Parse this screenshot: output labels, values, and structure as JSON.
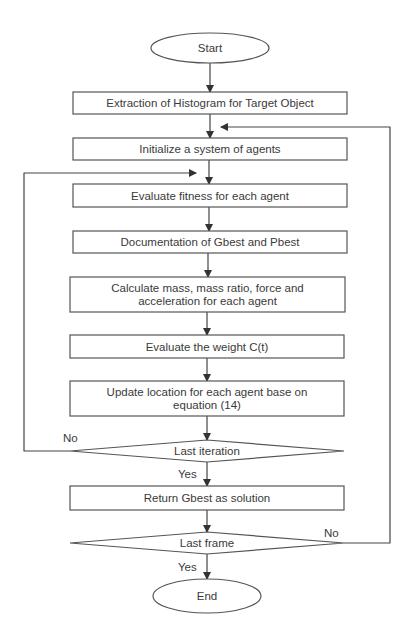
{
  "diagram": {
    "type": "flowchart",
    "colors": {
      "stroke": "#555555",
      "edge": "#444444",
      "text": "#3a3a3a",
      "fill": "#ffffff"
    },
    "nodes": [
      {
        "id": "start",
        "shape": "ellipse",
        "cx": 210,
        "cy": 48,
        "rx": 59,
        "ry": 15,
        "lines": [
          "Start"
        ]
      },
      {
        "id": "extract",
        "shape": "rect",
        "x": 73,
        "y": 92,
        "w": 274,
        "h": 22,
        "lines": [
          "Extraction of Histogram for Target Object"
        ]
      },
      {
        "id": "init",
        "shape": "rect",
        "x": 73,
        "y": 138,
        "w": 274,
        "h": 22,
        "lines": [
          "Initialize a system of agents"
        ]
      },
      {
        "id": "fitness",
        "shape": "rect",
        "x": 73,
        "y": 184,
        "w": 274,
        "h": 23,
        "lines": [
          "Evaluate fitness for each agent"
        ]
      },
      {
        "id": "document",
        "shape": "rect",
        "x": 73,
        "y": 231,
        "w": 274,
        "h": 22,
        "lines": [
          "Documentation of Gbest and Pbest"
        ]
      },
      {
        "id": "calculate",
        "shape": "rect",
        "x": 70,
        "y": 277,
        "w": 275,
        "h": 35,
        "lines": [
          "Calculate mass, mass ratio, force and",
          "acceleration for each agent"
        ]
      },
      {
        "id": "weight",
        "shape": "rect",
        "x": 70,
        "y": 335,
        "w": 274,
        "h": 23,
        "lines": [
          "Evaluate the weight C(t)"
        ]
      },
      {
        "id": "update",
        "shape": "rect",
        "x": 70,
        "y": 381,
        "w": 274,
        "h": 35,
        "lines": [
          "Update location for each agent base on",
          "equation (14)"
        ]
      },
      {
        "id": "last_iter",
        "shape": "diamond",
        "cx": 207,
        "cy": 451,
        "hw": 137,
        "hh": 11,
        "lines": [
          "Last iteration"
        ]
      },
      {
        "id": "return",
        "shape": "rect",
        "x": 70,
        "y": 486,
        "w": 274,
        "h": 24,
        "lines": [
          "Return Gbest as solution"
        ]
      },
      {
        "id": "last_frame",
        "shape": "diamond",
        "cx": 207,
        "cy": 543,
        "hw": 137,
        "hh": 11,
        "lines": [
          "Last frame"
        ]
      },
      {
        "id": "end",
        "shape": "ellipse",
        "cx": 207,
        "cy": 596,
        "rx": 54,
        "ry": 17,
        "lines": [
          "End"
        ]
      }
    ],
    "edges": [
      {
        "from": "start",
        "to": "extract",
        "points": [
          [
            210,
            63
          ],
          [
            210,
            92
          ]
        ]
      },
      {
        "from": "extract",
        "to": "init",
        "points": [
          [
            210,
            114
          ],
          [
            210,
            138
          ]
        ]
      },
      {
        "from": "init",
        "to": "fitness",
        "points": [
          [
            209,
            160
          ],
          [
            209,
            184
          ]
        ]
      },
      {
        "from": "fitness",
        "to": "document",
        "points": [
          [
            209,
            207
          ],
          [
            209,
            231
          ]
        ]
      },
      {
        "from": "document",
        "to": "calculate",
        "points": [
          [
            208,
            253
          ],
          [
            208,
            277
          ]
        ]
      },
      {
        "from": "calculate",
        "to": "weight",
        "points": [
          [
            207,
            312
          ],
          [
            207,
            335
          ]
        ]
      },
      {
        "from": "weight",
        "to": "update",
        "points": [
          [
            207,
            358
          ],
          [
            207,
            381
          ]
        ]
      },
      {
        "from": "update",
        "to": "last_iter",
        "points": [
          [
            207,
            416
          ],
          [
            207,
            440
          ]
        ]
      },
      {
        "from": "last_iter",
        "to": "return",
        "label": "Yes",
        "points": [
          [
            207,
            462
          ],
          [
            207,
            486
          ]
        ]
      },
      {
        "from": "return",
        "to": "last_frame",
        "points": [
          [
            207,
            510
          ],
          [
            207,
            532
          ]
        ]
      },
      {
        "from": "last_frame",
        "to": "end",
        "label": "Yes",
        "points": [
          [
            207,
            554
          ],
          [
            207,
            579
          ]
        ]
      },
      {
        "from": "last_iter",
        "to": "fitness",
        "label": "No",
        "points": [
          [
            70,
            451
          ],
          [
            24,
            451
          ],
          [
            24,
            173
          ],
          [
            196,
            173
          ]
        ]
      },
      {
        "from": "last_frame",
        "to": "init",
        "label": "No",
        "points": [
          [
            344,
            543
          ],
          [
            390,
            543
          ],
          [
            390,
            127
          ],
          [
            221,
            127
          ]
        ]
      }
    ],
    "edge_labels": [
      {
        "text": "No",
        "x": 63,
        "y": 442
      },
      {
        "text": "Yes",
        "x": 178,
        "y": 478
      },
      {
        "text": "No",
        "x": 324,
        "y": 537
      },
      {
        "text": "Yes",
        "x": 178,
        "y": 571
      }
    ]
  }
}
